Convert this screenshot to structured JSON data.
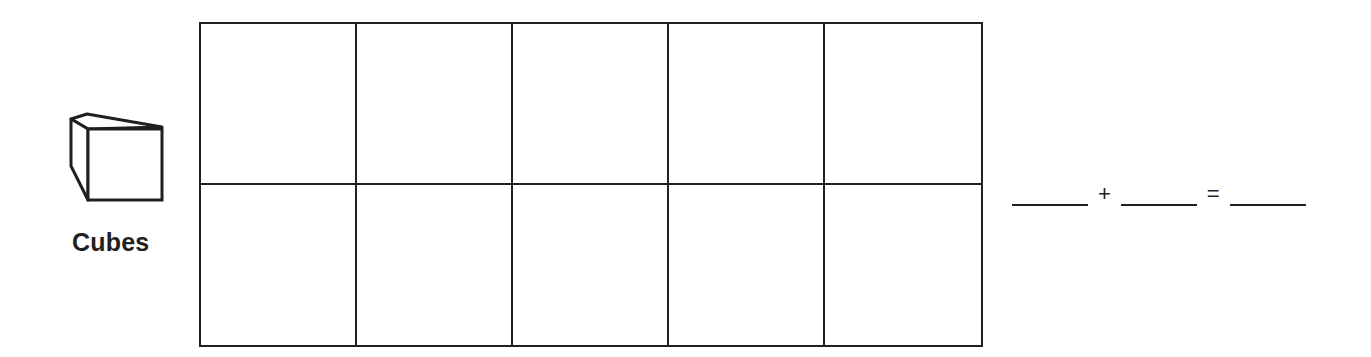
{
  "manipulative": {
    "icon": "cube-icon",
    "label": "Cubes"
  },
  "ten_frame": {
    "rows": 2,
    "columns": 5,
    "cells": [
      {
        "row": 1,
        "col": 1,
        "value": ""
      },
      {
        "row": 1,
        "col": 2,
        "value": ""
      },
      {
        "row": 1,
        "col": 3,
        "value": ""
      },
      {
        "row": 1,
        "col": 4,
        "value": ""
      },
      {
        "row": 1,
        "col": 5,
        "value": ""
      },
      {
        "row": 2,
        "col": 1,
        "value": ""
      },
      {
        "row": 2,
        "col": 2,
        "value": ""
      },
      {
        "row": 2,
        "col": 3,
        "value": ""
      },
      {
        "row": 2,
        "col": 4,
        "value": ""
      },
      {
        "row": 2,
        "col": 5,
        "value": ""
      }
    ]
  },
  "equation": {
    "addend1": "",
    "plus": "+",
    "addend2": "",
    "equals": "=",
    "sum": ""
  },
  "colors": {
    "ink": "#231f20",
    "paper": "#ffffff"
  }
}
